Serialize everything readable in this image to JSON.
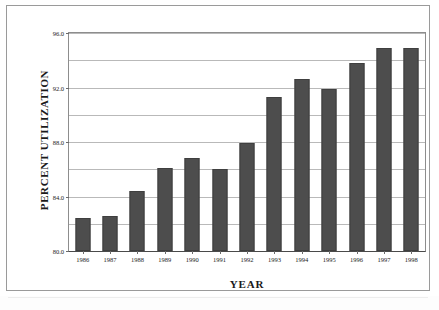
{
  "chart_data": {
    "type": "bar",
    "title": "",
    "xlabel": "YEAR",
    "ylabel": "PERCENT UTILIZATION",
    "categories": [
      "1986",
      "1987",
      "1988",
      "1989",
      "1990",
      "1991",
      "1992",
      "1993",
      "1994",
      "1995",
      "1996",
      "1997",
      "1998"
    ],
    "values": [
      82.4,
      82.6,
      84.4,
      86.1,
      86.8,
      86.0,
      87.9,
      91.3,
      92.6,
      91.9,
      93.8,
      94.9,
      94.9
    ],
    "series": [
      {
        "name": "Percent Utilization",
        "values": [
          82.4,
          82.6,
          84.4,
          86.1,
          86.8,
          86.0,
          87.9,
          91.3,
          92.6,
          91.9,
          93.8,
          94.9,
          94.9
        ]
      }
    ],
    "ylim": [
      80.0,
      96.0
    ],
    "ytick_step": 2.0,
    "ytick_values": [
      96.0,
      94.0,
      92.0,
      90.0,
      88.0,
      86.0,
      84.0,
      82.0,
      80.0
    ],
    "ytick_labels": [
      "96.0",
      "",
      "92.0",
      "",
      "88.0",
      "",
      "84.0",
      "",
      "80.0"
    ],
    "grid": true,
    "legend": false,
    "legend_position": "none",
    "bar_color": "#4d4d4d",
    "gridline_color": "#b9b9b9",
    "axis_color": "#4a4a4a",
    "background_color": "#ffffff"
  },
  "figure": {
    "border_color": "#9a9a9a"
  }
}
